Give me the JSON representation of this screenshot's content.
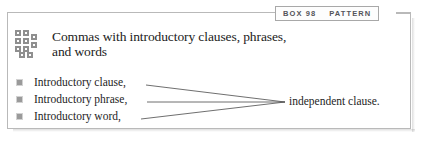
{
  "tab": {
    "box_label": "BOX 98",
    "type_label": "PATTERN"
  },
  "header": {
    "icon": "grid-motif-icon",
    "title_line_1": "Commas with introductory clauses, phrases,",
    "title_line_2": "and words"
  },
  "list": {
    "items": [
      {
        "prefix": "Introductory clause",
        "comma": ","
      },
      {
        "prefix": "Introductory phrase",
        "comma": ","
      },
      {
        "prefix": "Introductory word",
        "comma": ","
      }
    ]
  },
  "result": {
    "label": "independent clause."
  },
  "colors": {
    "frame": "#b9b9b9",
    "bullet": "#9a9a9a",
    "highlight": "#c9c9c9",
    "connector": "#4a4a4a",
    "tab_text": "#54545a",
    "body_text": "#1d1d1d"
  },
  "diagram_data": {
    "type": "diagram",
    "description": "Three introductory element types converge on a single independent clause",
    "sources": [
      "Introductory clause,",
      "Introductory phrase,",
      "Introductory word,"
    ],
    "target": "independent clause.",
    "convergence_point": {
      "x": 285,
      "y": 102
    }
  }
}
